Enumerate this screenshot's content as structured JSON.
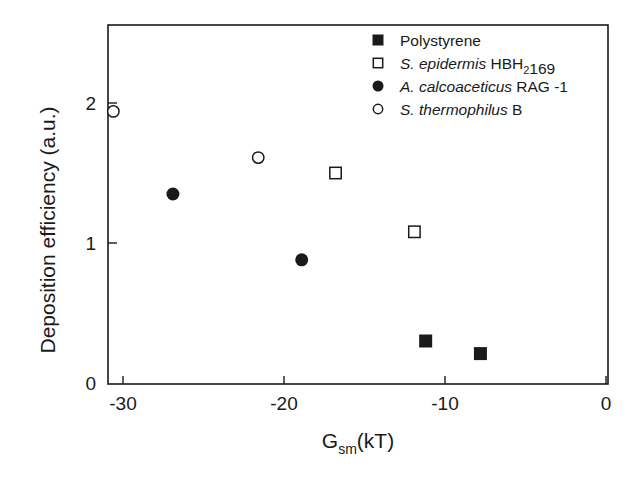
{
  "chart_data": {
    "type": "scatter",
    "title": "",
    "xlabel": "G_sm(kT)",
    "xlabel_main": "G",
    "xlabel_sub": "sm",
    "xlabel_tail": "(kT)",
    "ylabel": "Deposition efficiency (a.u.)",
    "xlim": [
      -31,
      0
    ],
    "ylim": [
      0,
      2.6
    ],
    "xticks": [
      -30,
      -20,
      -10,
      0
    ],
    "xtick_labels": [
      "-30",
      "-20",
      "-10",
      "0"
    ],
    "yticks": [
      0,
      1,
      2
    ],
    "ytick_labels": [
      "0",
      "1",
      "2"
    ],
    "grid": false,
    "legend_position": "upper right (inside)",
    "series": [
      {
        "name": "Polystyrene",
        "legend_parts": [
          {
            "t": "Polystyrene",
            "style": "normal"
          }
        ],
        "marker": "filled-square",
        "x": [
          -11.2,
          -7.8
        ],
        "y": [
          0.3,
          0.21
        ]
      },
      {
        "name": "S. epidermis HBH2169",
        "legend_parts": [
          {
            "t": "S. epidermis",
            "style": "italic"
          },
          {
            "t": " HBH",
            "style": "normal"
          },
          {
            "t": "2",
            "style": "sub"
          },
          {
            "t": "169",
            "style": "normal"
          }
        ],
        "marker": "open-square",
        "x": [
          -16.8,
          -11.9
        ],
        "y": [
          1.5,
          1.08
        ]
      },
      {
        "name": "A. calcoaceticus RAG -1",
        "legend_parts": [
          {
            "t": "A. calcoaceticus",
            "style": "italic"
          },
          {
            "t": " RAG -1",
            "style": "normal"
          }
        ],
        "marker": "filled-circle",
        "x": [
          -26.9,
          -18.9
        ],
        "y": [
          1.35,
          0.88
        ]
      },
      {
        "name": "S. thermophilus B",
        "legend_parts": [
          {
            "t": "S. thermophilus",
            "style": "italic"
          },
          {
            "t": " B",
            "style": "normal"
          }
        ],
        "marker": "open-circle",
        "x": [
          -30.6,
          -21.6
        ],
        "y": [
          1.94,
          1.61
        ]
      }
    ],
    "colors": {
      "ink": "#1a1a1a",
      "background": "#ffffff"
    }
  }
}
